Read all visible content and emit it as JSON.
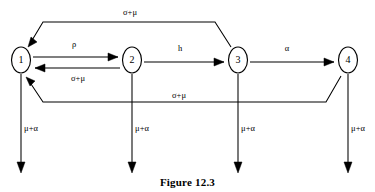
{
  "figure": {
    "caption": "Figure 12.3",
    "caption_x": 187,
    "caption_y": 176,
    "background_color": "#ffffff",
    "ink_color": "#000000"
  },
  "nodes": [
    {
      "id": "1",
      "label": "1",
      "cx": 21,
      "cy": 60,
      "rx": 9.5,
      "ry": 13
    },
    {
      "id": "2",
      "label": "2",
      "cx": 132,
      "cy": 60,
      "rx": 9.5,
      "ry": 13
    },
    {
      "id": "3",
      "label": "3",
      "cx": 238,
      "cy": 60,
      "rx": 9.5,
      "ry": 13
    },
    {
      "id": "4",
      "label": "4",
      "cx": 348,
      "cy": 60,
      "rx": 9.5,
      "ry": 13
    }
  ],
  "edges": [
    {
      "id": "edge-1-to-2",
      "from": "1",
      "to": "2",
      "label": "ρ",
      "label_x": 74,
      "label_y": 45,
      "path": "M 33 57 L 118 57",
      "arrow": "118,57 108,53 108,61"
    },
    {
      "id": "edge-2-to-1",
      "from": "2",
      "to": "1",
      "label": "σ+μ",
      "label_x": 78,
      "label_y": 79,
      "path": "M 120 68 L 35 68",
      "arrow": "35,68 45,64 45,72"
    },
    {
      "id": "edge-2-to-3",
      "from": "2",
      "to": "3",
      "label": "h",
      "label_x": 180,
      "label_y": 49,
      "path": "M 144 62 L 224 62",
      "arrow": "224,62 214,58 214,66"
    },
    {
      "id": "edge-3-to-4",
      "from": "3",
      "to": "4",
      "label": "α",
      "label_x": 287,
      "label_y": 49,
      "path": "M 250 62 L 334 62",
      "arrow": "334,62 324,58 324,66"
    },
    {
      "id": "edge-3-to-1-top",
      "from": "3",
      "to": "1",
      "label": "σ+μ",
      "label_x": 130,
      "label_y": 13,
      "path": "M 231 47 L 215 22 L 43 22 L 31 42",
      "arrow": "28,47 37,42 31,37"
    },
    {
      "id": "edge-4-to-1-bottom",
      "from": "4",
      "to": "1",
      "label": "σ+μ",
      "label_x": 179,
      "label_y": 96,
      "path": "M 341 76 L 326 102 L 43 102 L 29 81",
      "arrow": "26,77 35,81 30,86"
    },
    {
      "id": "edge-1-exit",
      "from": "1",
      "to": "exit",
      "label": "μ+α",
      "label_x": 31,
      "label_y": 129,
      "path": "M 21 74 L 21 165",
      "arrow": "21,173 17,162 25,162"
    },
    {
      "id": "edge-2-exit",
      "from": "2",
      "to": "exit",
      "label": "μ+α",
      "label_x": 142,
      "label_y": 129,
      "path": "M 132 74 L 132 165",
      "arrow": "132,173 128,162 136,162"
    },
    {
      "id": "edge-3-exit",
      "from": "3",
      "to": "exit",
      "label": "μ+α",
      "label_x": 248,
      "label_y": 129,
      "path": "M 238 74 L 238 165",
      "arrow": "238,173 234,162 242,162"
    },
    {
      "id": "edge-4-exit",
      "from": "4",
      "to": "exit",
      "label": "μ+α",
      "label_x": 358,
      "label_y": 129,
      "path": "M 348 74 L 348 165",
      "arrow": "348,173 344,162 352,162"
    }
  ]
}
